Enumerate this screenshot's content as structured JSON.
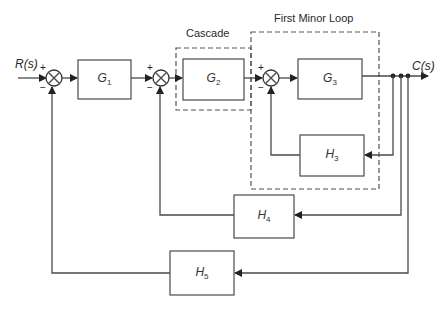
{
  "diagram": {
    "type": "feedback block diagram",
    "input_label": "R(s)",
    "output_label": "C(s)",
    "group_labels": {
      "cascade": "Cascade",
      "minor_loop": "First Minor Loop"
    },
    "blocks": [
      {
        "id": "G1",
        "name": "G",
        "sub": "1"
      },
      {
        "id": "G2",
        "name": "G",
        "sub": "2"
      },
      {
        "id": "G3",
        "name": "G",
        "sub": "3"
      },
      {
        "id": "H3",
        "name": "H",
        "sub": "3"
      },
      {
        "id": "H4",
        "name": "H",
        "sub": "4"
      },
      {
        "id": "H5",
        "name": "H",
        "sub": "5"
      }
    ],
    "summing_junctions": [
      {
        "id": "S1",
        "plus": "+",
        "minus": "−"
      },
      {
        "id": "S2",
        "plus": "+",
        "minus": "−"
      },
      {
        "id": "S3",
        "plus": "+",
        "minus": "−"
      }
    ],
    "connections": [
      "R(s) -> S1(+)",
      "S1 -> G1",
      "G1 -> S2(+)",
      "S2 -> G2",
      "G2 -> S3(+)",
      "S3 -> G3",
      "G3 -> C(s)",
      "C(s) -> H3 -> S3(-)",
      "C(s) -> H4 -> S2(-)",
      "C(s) -> H5 -> S1(-)"
    ]
  }
}
